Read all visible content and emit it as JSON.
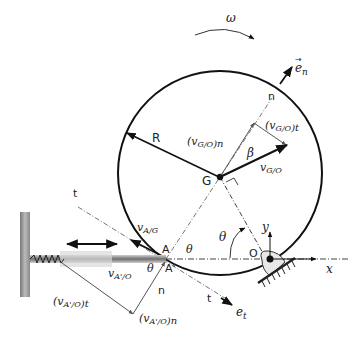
{
  "diagram": {
    "labels": {
      "omega": "ω",
      "e_n": "e",
      "e_n_sub": "n",
      "e_t": "e",
      "e_t_sub": "t",
      "R": "R",
      "G": "G",
      "O": "O",
      "A": "A",
      "A_prime": "A'",
      "n_axis_top": "n",
      "n_axis_bottom": "n",
      "t_axis_top": "t",
      "t_axis_bottom": "t",
      "x_axis": "x",
      "y_axis": "y",
      "beta": "β",
      "theta_1": "θ",
      "theta_2": "θ",
      "theta_3": "θ",
      "v_GO_n": "(v",
      "v_GO_n_sub": "G/O",
      "v_GO_n_tail": ")n",
      "v_GO_t": "(v",
      "v_GO_t_sub": "G/O",
      "v_GO_t_tail": ")t",
      "v_GO": "v",
      "v_GO_sub": "G/O",
      "v_AG": "v",
      "v_AG_sub": "A/G",
      "v_ApO": "v",
      "v_ApO_sub": "A'/O",
      "v_ApO_t": "(v",
      "v_ApO_t_sub": "A'/O",
      "v_ApO_t_tail": ")t",
      "v_ApO_n": "(v",
      "v_ApO_n_sub": "A'/O",
      "v_ApO_n_tail": ")n"
    },
    "colors": {
      "stroke": "#111111",
      "thin": "#555555",
      "wall": "#9a9a9a",
      "rod": "#8a8a8a",
      "pivot_fill": "#e6e6e6"
    }
  }
}
